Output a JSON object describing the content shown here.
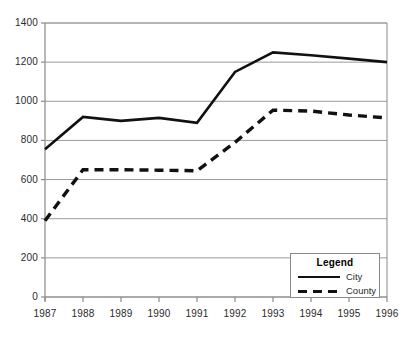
{
  "chart_data": {
    "type": "line",
    "title": "",
    "subtitle": "",
    "xlabel": "",
    "ylabel": "",
    "categories": [
      "1987",
      "1988",
      "1989",
      "1990",
      "1991",
      "1992",
      "1993",
      "1994",
      "1995",
      "1996"
    ],
    "x": [
      1987,
      1988,
      1989,
      1990,
      1991,
      1992,
      1993,
      1994,
      1995,
      1996
    ],
    "series": [
      {
        "name": "City",
        "style": "solid",
        "color": "#111111",
        "values": [
          755,
          920,
          900,
          915,
          890,
          1150,
          1250,
          1235,
          1218,
          1200
        ]
      },
      {
        "name": "County",
        "style": "dashed",
        "color": "#111111",
        "values": [
          390,
          650,
          650,
          648,
          645,
          790,
          955,
          950,
          930,
          915
        ]
      }
    ],
    "ylim": [
      0,
      1400
    ],
    "ytick_values": [
      0,
      200,
      400,
      600,
      800,
      1000,
      1200,
      1400
    ],
    "ytick_labels": [
      "0",
      "200",
      "400",
      "600",
      "800",
      "1000",
      "1200",
      "1400"
    ],
    "xtick_labels": [
      "1987",
      "1988",
      "1989",
      "1990",
      "1991",
      "1992",
      "1993",
      "1994",
      "1995",
      "1996"
    ],
    "grid": true,
    "grid_axis": "y",
    "grid_color": "#9a9a9a",
    "axis_color": "#8a8a8a",
    "legend_position": "bottom-right",
    "legend": {
      "title": "Legend",
      "entries": [
        {
          "label": "City",
          "style": "solid"
        },
        {
          "label": "County",
          "style": "dashed"
        }
      ]
    }
  }
}
